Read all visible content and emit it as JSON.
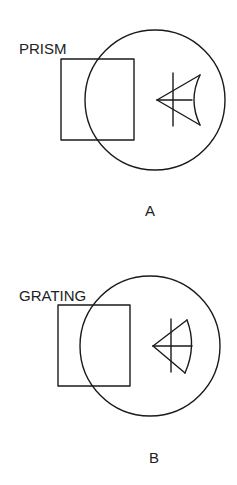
{
  "diagrams": [
    {
      "id": "A",
      "caption": "A",
      "component_label": "PRISM",
      "circle": {
        "cx": 155,
        "cy": 100,
        "r": 70
      },
      "rect": {
        "x": 61,
        "y": 59,
        "w": 73,
        "h": 81
      },
      "label_pos": {
        "x": 19,
        "y": 54
      },
      "caption_pos": {
        "x": 150,
        "y": 216
      },
      "eye": {
        "apex": [
          157,
          100
        ],
        "vline": [
          173,
          73,
          173,
          126
        ],
        "hline": [
          157,
          100,
          192,
          100
        ],
        "top": [
          200,
          75
        ],
        "bottom": [
          200,
          125
        ],
        "arc_ctrl": [
          188,
          100
        ]
      }
    },
    {
      "id": "B",
      "caption": "B",
      "component_label": "GRATING",
      "circle": {
        "cx": 150,
        "cy": 346,
        "r": 70
      },
      "rect": {
        "x": 58,
        "y": 305,
        "w": 72,
        "h": 81
      },
      "label_pos": {
        "x": 19,
        "y": 301
      },
      "caption_pos": {
        "x": 154,
        "y": 463
      },
      "eye": {
        "apex": [
          153,
          346
        ],
        "vline": [
          171,
          319,
          171,
          372
        ],
        "hline": [
          153,
          346,
          192,
          346
        ],
        "top": [
          187,
          320
        ],
        "bottom": [
          185,
          373
        ],
        "arc_ctrl": [
          197,
          346
        ]
      }
    }
  ],
  "colors": {
    "ink": "#1a1a1a",
    "background": "#ffffff"
  }
}
